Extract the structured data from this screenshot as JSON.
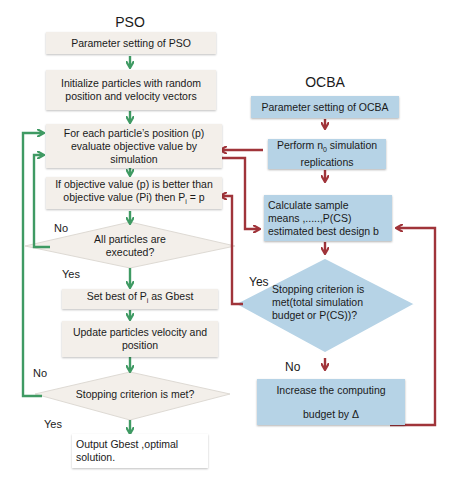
{
  "colors": {
    "pso_box": "#f3efea",
    "ocba_box": "#b6d3e6",
    "pso_arrow": "#3f9a63",
    "ocba_arrow": "#a0343a"
  },
  "pso": {
    "title": "PSO",
    "steps": [
      {
        "text": "Parameter setting of PSO"
      },
      {
        "line1": "Initialize particles with random",
        "line2": "position and velocity vectors"
      },
      {
        "line1": "For each particle’s position (p)",
        "line2": "evaluate objective value by",
        "line3": "simulation"
      },
      {
        "line1": "If objective value (p) is better than",
        "line2_pre": "objective value (Pi) then P",
        "line2_sub": "i",
        "line2_post": " = p"
      },
      {
        "line1": "All particles are",
        "line2": "executed?",
        "shape": "diamond"
      },
      {
        "pre": "Set best of P",
        "sub": "i",
        "post": " as Gbest"
      },
      {
        "line1": "Update particles velocity and",
        "line2": "position"
      },
      {
        "text": "Stopping criterion is met?",
        "shape": "diamond"
      },
      {
        "line1": "Output Gbest ,optimal",
        "line2": "solution."
      }
    ],
    "labels": {
      "no_1": "No",
      "yes_1": "Yes",
      "no_2": "No",
      "yes_2": "Yes"
    }
  },
  "ocba": {
    "title": "OCBA",
    "steps": [
      {
        "text": "Parameter setting of OCBA"
      },
      {
        "pre": "Perform n",
        "sub": "0",
        "post": " simulation",
        "line2": "replications"
      },
      {
        "line1": "Calculate sample",
        "line2": "means ,.....,P(CS)",
        "line3": "estimated best design b"
      },
      {
        "line1": "Stopping criterion is",
        "line2": "met(total simulation",
        "line3": "budget or P(CS))?",
        "shape": "diamond"
      },
      {
        "line1": "Increase the computing",
        "line2": "budget by Δ"
      }
    ],
    "labels": {
      "yes": "Yes",
      "no": "No"
    }
  }
}
